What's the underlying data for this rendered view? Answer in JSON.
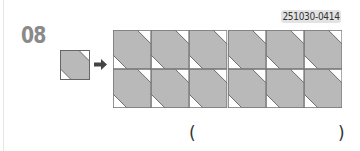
{
  "problem": {
    "number": "08",
    "code": "251030-0414"
  },
  "figure": {
    "single_tile": {
      "icon": "diagonal-band-tile-icon"
    },
    "arrow": {
      "icon": "right-arrow-icon"
    },
    "grid": {
      "rows": 2,
      "cols": 6,
      "tile_icon": "diagonal-band-tile-icon"
    },
    "colors": {
      "tile_fill": "#b9b9b9",
      "tile_edge": "#555555",
      "background": "#ffffff",
      "number": "#8a8a8a",
      "badge_bg": "#e3e3e3"
    }
  },
  "answer": {
    "open": "(",
    "close": ")",
    "value": ""
  }
}
